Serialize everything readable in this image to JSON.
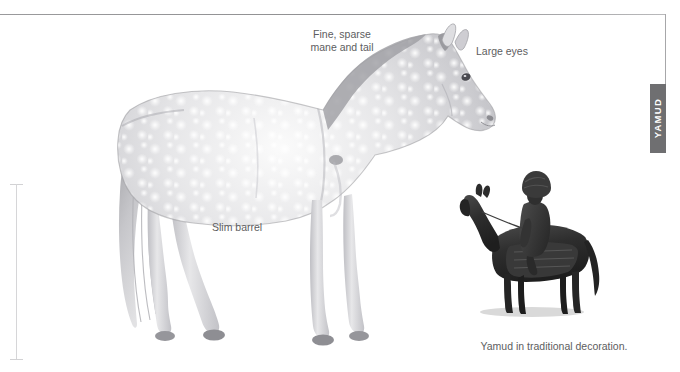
{
  "page": {
    "breed_tab_label": "YAMUD",
    "clipped_heading": "",
    "frame_color": "#9a9a9c",
    "tab_background": "#6f6f71",
    "tab_text_color": "#ffffff",
    "label_color": "#5d5d60",
    "measure_color": "#d6d6d8"
  },
  "callouts": [
    {
      "id": "mane",
      "text": "Fine, sparse\nmane and tail"
    },
    {
      "id": "eyes",
      "text": "Large eyes"
    },
    {
      "id": "barrel",
      "text": "Slim barrel"
    }
  ],
  "inset": {
    "caption": "Yamud in traditional decoration."
  },
  "illustrations": [
    {
      "name": "main-horse-illustration",
      "subject": "Yamud horse standing in profile facing right",
      "coat": "dappled grey",
      "colors": {
        "body_light": "#f3f3f3",
        "body_mid": "#cfcfd2",
        "body_shade": "#9d9da2",
        "outline": "#8a8a8f"
      }
    },
    {
      "name": "inset-rider-illustration",
      "subject": "Dark Yamud horse with mounted rider in traditional dress and tall fur hat",
      "colors": {
        "horse": "#2d2d2d",
        "rider": "#3a3a3a",
        "shadow": "#d7d7d7"
      }
    }
  ],
  "measure": {
    "name": "height-measure-bar",
    "orientation": "vertical"
  }
}
